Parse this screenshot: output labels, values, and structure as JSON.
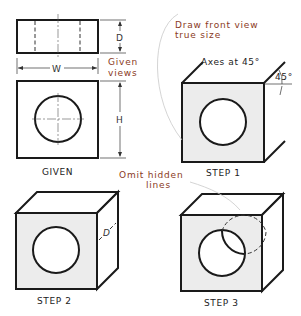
{
  "figure": {
    "panels": [
      {
        "id": "given",
        "caption": "GIVEN"
      },
      {
        "id": "step1",
        "caption": "STEP 1"
      },
      {
        "id": "step2",
        "caption": "STEP 2"
      },
      {
        "id": "step3",
        "caption": "STEP 3"
      }
    ],
    "dimensions": {
      "width": "W",
      "height": "H",
      "depth": "D",
      "depth_step2": "D"
    },
    "annotations": {
      "given_views_line1": "Given",
      "given_views_line2": "views",
      "draw_front_line1": "Draw front view",
      "draw_front_line2": "true size",
      "axes": "Axes at 45°",
      "angle": "45°",
      "omit_hidden_line1": "Omit hidden",
      "omit_hidden_line2": "lines"
    },
    "colors": {
      "annotation": "#8a3a24",
      "line": "#1a1a1a",
      "face_fill": "#ececec"
    }
  }
}
